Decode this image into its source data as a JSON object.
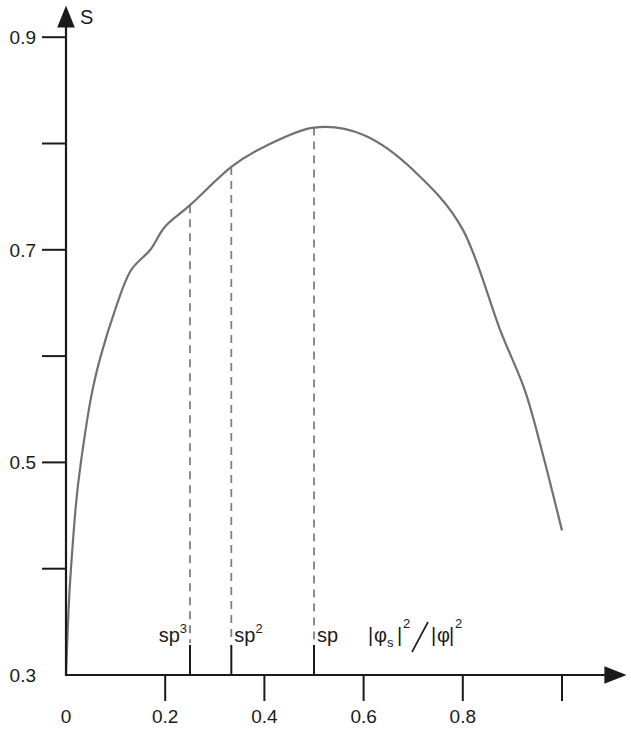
{
  "chart_data": {
    "type": "line",
    "title": "",
    "xlabel": "|φs|²/|φ|²",
    "ylabel": "S",
    "xlim": [
      0,
      1.0
    ],
    "ylim": [
      0.3,
      0.9
    ],
    "grid": false,
    "x_ticks": [
      0,
      0.2,
      0.4,
      0.6,
      0.8,
      1.0
    ],
    "x_tick_labels": [
      "0",
      "0.2",
      "0.4",
      "0.6",
      "0.8",
      ""
    ],
    "y_ticks": [
      0.3,
      0.4,
      0.5,
      0.6,
      0.7,
      0.8,
      0.9
    ],
    "y_tick_labels": [
      "0.3",
      "",
      "0.5",
      "",
      "0.7",
      "",
      "0.9"
    ],
    "series": [
      {
        "name": "S",
        "color": "#707070",
        "x": [
          0,
          0.005,
          0.01,
          0.02,
          0.03,
          0.05,
          0.07,
          0.1,
          0.13,
          0.17,
          0.2,
          0.25,
          0.3333,
          0.4,
          0.5,
          0.6,
          0.7,
          0.8,
          0.875,
          0.925,
          0.96,
          1.0
        ],
        "y": [
          0.3,
          0.36,
          0.4,
          0.46,
          0.5,
          0.56,
          0.6,
          0.645,
          0.68,
          0.7,
          0.722,
          0.742,
          0.778,
          0.797,
          0.815,
          0.808,
          0.775,
          0.719,
          0.625,
          0.568,
          0.51,
          0.436
        ]
      }
    ],
    "annotations": [
      {
        "label": "sp",
        "sup": "3",
        "x": 0.25,
        "y": 0.742,
        "style": "dashed"
      },
      {
        "label": "sp",
        "sup": "2",
        "x": 0.3333,
        "y": 0.778,
        "style": "dashed"
      },
      {
        "label": "sp",
        "sup": "",
        "x": 0.5,
        "y": 0.815,
        "style": "dashed"
      }
    ]
  },
  "axis": {
    "y_label": "S",
    "x_label_parts": {
      "phi": "φ",
      "sub": "s",
      "exp": "2"
    }
  }
}
